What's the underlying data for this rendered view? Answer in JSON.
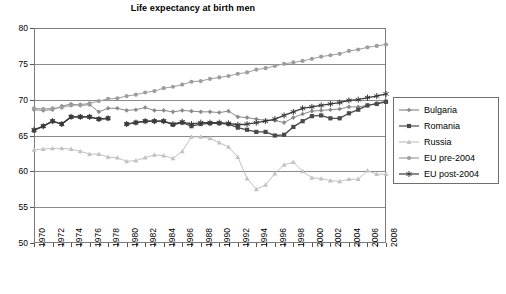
{
  "chart": {
    "title": "Life expectancy at birth men"
  },
  "axes": {
    "y_ticks": [
      "80",
      "75",
      "70",
      "65",
      "60",
      "55",
      "50"
    ],
    "x_ticks": [
      "1970",
      "1972",
      "1974",
      "1976",
      "1978",
      "1980",
      "1982",
      "1984",
      "1986",
      "1988",
      "1990",
      "1992",
      "1994",
      "1996",
      "1998",
      "2000",
      "2002",
      "2004",
      "2006",
      "2008"
    ]
  },
  "legend": {
    "items": [
      {
        "label": "Bulgaria",
        "marker": "diamond-marker",
        "color": "#8a8a8a"
      },
      {
        "label": "Romania",
        "marker": "square-marker",
        "color": "#4a4a4a"
      },
      {
        "label": "Russia",
        "marker": "triangle-marker",
        "color": "#c2c2c2"
      },
      {
        "label": "EU pre-2004",
        "marker": "circle-marker",
        "color": "#9e9e9e"
      },
      {
        "label": "EU post-2004",
        "marker": "asterisk-marker",
        "color": "#3a3a3a"
      }
    ]
  },
  "chart_data": {
    "type": "line",
    "title": "Life expectancy at birth men",
    "xlabel": "",
    "ylabel": "",
    "xlim": [
      1970,
      2008
    ],
    "ylim": [
      50,
      80
    ],
    "ytick_step": 5,
    "grid": true,
    "legend_position": "right",
    "x": [
      1970,
      1971,
      1972,
      1973,
      1974,
      1975,
      1976,
      1977,
      1978,
      1979,
      1980,
      1981,
      1982,
      1983,
      1984,
      1985,
      1986,
      1987,
      1988,
      1989,
      1990,
      1991,
      1992,
      1993,
      1994,
      1995,
      1996,
      1997,
      1998,
      1999,
      2000,
      2001,
      2002,
      2003,
      2004,
      2005,
      2006,
      2007,
      2008
    ],
    "series": [
      {
        "name": "Bulgaria",
        "marker": "diamond",
        "color": "#8a8a8a",
        "values": [
          68.6,
          68.5,
          68.6,
          69.1,
          69.4,
          69.2,
          69.3,
          68.3,
          68.8,
          68.8,
          68.5,
          68.6,
          68.9,
          68.5,
          68.5,
          68.3,
          68.5,
          68.4,
          68.3,
          68.3,
          68.2,
          68.4,
          67.6,
          67.5,
          67.3,
          67.1,
          67.1,
          66.8,
          67.5,
          68.0,
          68.4,
          68.5,
          68.6,
          68.7,
          69.0,
          69.0,
          69.2,
          69.5,
          69.8
        ]
      },
      {
        "name": "Romania",
        "marker": "square",
        "color": "#4a4a4a",
        "values": [
          65.7,
          66.3,
          67.0,
          66.6,
          67.6,
          67.6,
          67.6,
          67.3,
          67.4,
          null,
          66.6,
          66.8,
          67.0,
          67.0,
          67.0,
          66.5,
          66.8,
          66.3,
          66.6,
          66.7,
          66.7,
          66.6,
          66.1,
          65.8,
          65.5,
          65.5,
          65.0,
          65.1,
          66.2,
          67.0,
          67.7,
          67.8,
          67.4,
          67.4,
          68.1,
          68.6,
          69.2,
          69.4,
          69.7
        ]
      },
      {
        "name": "Russia",
        "marker": "triangle",
        "color": "#c2c2c2",
        "values": [
          63.0,
          63.1,
          63.2,
          63.2,
          63.1,
          62.8,
          62.4,
          62.4,
          62.0,
          61.9,
          61.4,
          61.5,
          61.9,
          62.3,
          62.2,
          61.8,
          62.8,
          64.8,
          64.8,
          64.6,
          64.0,
          63.4,
          62.0,
          59.0,
          57.5,
          58.1,
          59.7,
          60.9,
          61.3,
          60.0,
          59.1,
          59.0,
          58.7,
          58.6,
          58.9,
          58.9,
          60.1,
          59.6,
          59.6
        ]
      },
      {
        "name": "EU pre-2004",
        "marker": "circle",
        "color": "#9e9e9e",
        "values": [
          68.8,
          68.7,
          68.8,
          68.9,
          69.2,
          69.3,
          69.5,
          69.8,
          70.1,
          70.2,
          70.5,
          70.7,
          71.0,
          71.2,
          71.6,
          71.8,
          72.1,
          72.5,
          72.6,
          72.9,
          73.1,
          73.3,
          73.6,
          73.8,
          74.2,
          74.4,
          74.7,
          75.0,
          75.2,
          75.4,
          75.7,
          76.0,
          76.2,
          76.4,
          76.8,
          77.0,
          77.3,
          77.5,
          77.7
        ]
      },
      {
        "name": "EU post-2004",
        "marker": "asterisk",
        "color": "#3a3a3a",
        "values": [
          65.8,
          66.3,
          67.0,
          66.6,
          67.6,
          67.6,
          67.6,
          67.3,
          67.4,
          null,
          66.6,
          66.8,
          67.0,
          67.0,
          67.0,
          66.6,
          66.9,
          66.6,
          66.8,
          66.8,
          66.8,
          66.7,
          66.5,
          66.6,
          66.8,
          67.0,
          67.3,
          67.8,
          68.3,
          68.8,
          69.0,
          69.2,
          69.4,
          69.6,
          69.9,
          70.0,
          70.3,
          70.5,
          70.8
        ]
      }
    ]
  }
}
